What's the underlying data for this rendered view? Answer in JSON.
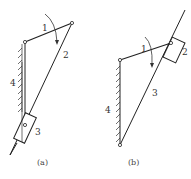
{
  "diagram": {
    "type": "mechanism-linkage",
    "figures": [
      {
        "id": "a",
        "caption": "(a)",
        "labels": {
          "link1": "1",
          "link2": "2",
          "link3": "3",
          "link4": "4"
        },
        "description": "Crank 1 pivoted on fixed frame 4, link 2 sliding through slider 3 pivoted on frame"
      },
      {
        "id": "b",
        "caption": "(b)",
        "labels": {
          "link1": "1",
          "link2": "2",
          "link3": "3",
          "link4": "4"
        },
        "description": "Crank 1 pivoted on fixed frame 4, slider 2 on crank tip sliding along link 3 pivoted at frame bottom"
      }
    ],
    "colors": {
      "line": "#222222",
      "background": "#ffffff"
    }
  }
}
